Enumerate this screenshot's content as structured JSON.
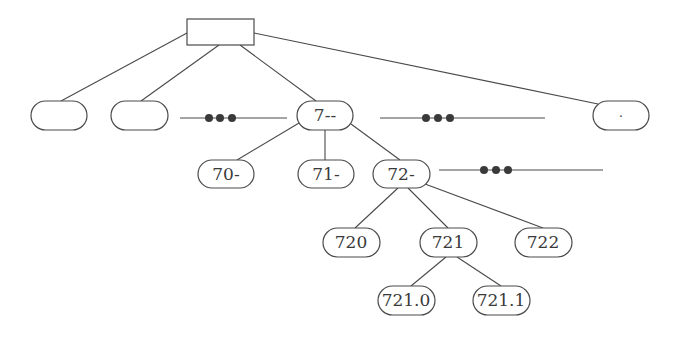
{
  "diagram": {
    "type": "tree",
    "root": {
      "id": "root",
      "label": "",
      "shape": "rectangle"
    },
    "nodes": [
      {
        "id": "n1",
        "label": ""
      },
      {
        "id": "n2",
        "label": ""
      },
      {
        "id": "n7",
        "label": "7--"
      },
      {
        "id": "nlast",
        "label": "."
      },
      {
        "id": "n70",
        "label": "70-"
      },
      {
        "id": "n71",
        "label": "71-"
      },
      {
        "id": "n72",
        "label": "72-"
      },
      {
        "id": "n720",
        "label": "720"
      },
      {
        "id": "n721",
        "label": "721"
      },
      {
        "id": "n722",
        "label": "722"
      },
      {
        "id": "n7210",
        "label": "721.0"
      },
      {
        "id": "n7211",
        "label": "721.1"
      }
    ],
    "edges": [
      [
        "root",
        "n1"
      ],
      [
        "root",
        "n2"
      ],
      [
        "root",
        "n7"
      ],
      [
        "root",
        "nlast"
      ],
      [
        "n7",
        "n70"
      ],
      [
        "n7",
        "n71"
      ],
      [
        "n7",
        "n72"
      ],
      [
        "n72",
        "n720"
      ],
      [
        "n72",
        "n721"
      ],
      [
        "n72",
        "n722"
      ],
      [
        "n721",
        "n7210"
      ],
      [
        "n721",
        "n7211"
      ]
    ],
    "ellipses": [
      {
        "id": "ellipsis-level1-left",
        "symbol": "•••"
      },
      {
        "id": "ellipsis-level1-right",
        "symbol": "•••"
      },
      {
        "id": "ellipsis-level2",
        "symbol": "•••"
      }
    ],
    "colors": {
      "stroke": "#4a4a4a",
      "text": "#3a3a3a",
      "background": "#ffffff"
    }
  }
}
